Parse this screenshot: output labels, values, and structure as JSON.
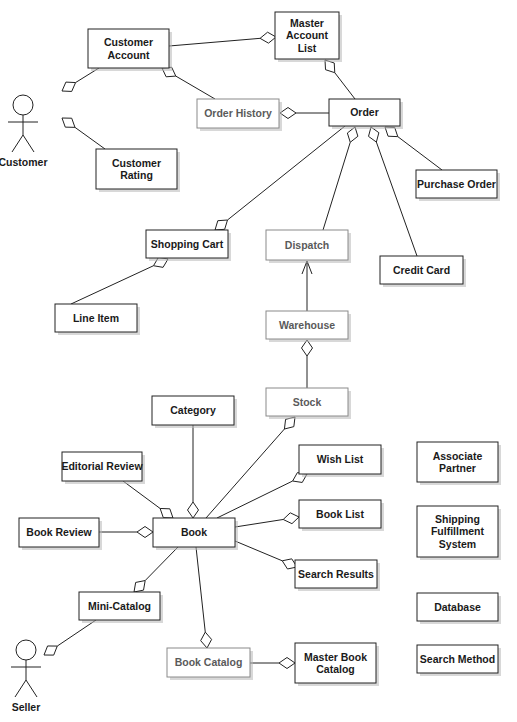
{
  "diagram": {
    "type": "UML class diagram (online bookstore)",
    "actors": [
      {
        "id": "customer",
        "label": "Customer",
        "x": 20,
        "y": 95
      },
      {
        "id": "seller",
        "label": "Seller",
        "x": 23,
        "y": 640
      }
    ],
    "classes": [
      {
        "id": "customer-account",
        "lines": [
          "Customer",
          "Account"
        ],
        "x": 88,
        "y": 29,
        "w": 81,
        "h": 39,
        "dim": false
      },
      {
        "id": "master-account-list",
        "lines": [
          "Master",
          "Account",
          "List"
        ],
        "x": 275,
        "y": 12,
        "w": 64,
        "h": 47,
        "dim": false
      },
      {
        "id": "order-history",
        "lines": [
          "Order History"
        ],
        "x": 197,
        "y": 99,
        "w": 82,
        "h": 29,
        "dim": true
      },
      {
        "id": "order",
        "lines": [
          "Order"
        ],
        "x": 329,
        "y": 99,
        "w": 71,
        "h": 27,
        "dim": false
      },
      {
        "id": "customer-rating",
        "lines": [
          "Customer",
          "Rating"
        ],
        "x": 96,
        "y": 149,
        "w": 81,
        "h": 40,
        "dim": false
      },
      {
        "id": "purchase-order",
        "lines": [
          "Purchase Order"
        ],
        "x": 416,
        "y": 170,
        "w": 81,
        "h": 28,
        "dim": false
      },
      {
        "id": "shopping-cart",
        "lines": [
          "Shopping Cart"
        ],
        "x": 146,
        "y": 230,
        "w": 82,
        "h": 28,
        "dim": false
      },
      {
        "id": "dispatch",
        "lines": [
          "Dispatch"
        ],
        "x": 266,
        "y": 230,
        "w": 82,
        "h": 30,
        "dim": true
      },
      {
        "id": "credit-card",
        "lines": [
          "Credit Card"
        ],
        "x": 380,
        "y": 256,
        "w": 83,
        "h": 28,
        "dim": false
      },
      {
        "id": "line-item",
        "lines": [
          "Line Item"
        ],
        "x": 55,
        "y": 304,
        "w": 82,
        "h": 28,
        "dim": false
      },
      {
        "id": "warehouse",
        "lines": [
          "Warehouse"
        ],
        "x": 266,
        "y": 311,
        "w": 82,
        "h": 28,
        "dim": true
      },
      {
        "id": "category",
        "lines": [
          "Category"
        ],
        "x": 152,
        "y": 396,
        "w": 82,
        "h": 29,
        "dim": false
      },
      {
        "id": "stock",
        "lines": [
          "Stock"
        ],
        "x": 266,
        "y": 388,
        "w": 82,
        "h": 28,
        "dim": true
      },
      {
        "id": "editorial-review",
        "lines": [
          "Editorial Review"
        ],
        "x": 62,
        "y": 452,
        "w": 80,
        "h": 29,
        "dim": false
      },
      {
        "id": "wish-list",
        "lines": [
          "Wish List"
        ],
        "x": 299,
        "y": 445,
        "w": 82,
        "h": 29,
        "dim": false
      },
      {
        "id": "associate-partner",
        "lines": [
          "Associate",
          "Partner"
        ],
        "x": 417,
        "y": 442,
        "w": 81,
        "h": 40,
        "dim": false
      },
      {
        "id": "book-review",
        "lines": [
          "Book Review"
        ],
        "x": 19,
        "y": 518,
        "w": 80,
        "h": 29,
        "dim": false
      },
      {
        "id": "book",
        "lines": [
          "Book"
        ],
        "x": 153,
        "y": 518,
        "w": 82,
        "h": 29,
        "dim": false
      },
      {
        "id": "book-list",
        "lines": [
          "Book List"
        ],
        "x": 299,
        "y": 500,
        "w": 82,
        "h": 28,
        "dim": false
      },
      {
        "id": "shipping-fulfillment-system",
        "lines": [
          "Shipping",
          "Fulfillment",
          "System"
        ],
        "x": 417,
        "y": 506,
        "w": 81,
        "h": 51,
        "dim": false
      },
      {
        "id": "search-results",
        "lines": [
          "Search Results"
        ],
        "x": 295,
        "y": 560,
        "w": 82,
        "h": 28,
        "dim": false
      },
      {
        "id": "mini-catalog",
        "lines": [
          "Mini-Catalog"
        ],
        "x": 79,
        "y": 592,
        "w": 81,
        "h": 28,
        "dim": false
      },
      {
        "id": "database",
        "lines": [
          "Database"
        ],
        "x": 417,
        "y": 593,
        "w": 81,
        "h": 28,
        "dim": false
      },
      {
        "id": "book-catalog",
        "lines": [
          "Book Catalog"
        ],
        "x": 167,
        "y": 648,
        "w": 83,
        "h": 29,
        "dim": true
      },
      {
        "id": "master-book-catalog",
        "lines": [
          "Master Book",
          "Catalog"
        ],
        "x": 295,
        "y": 643,
        "w": 81,
        "h": 40,
        "dim": false
      },
      {
        "id": "search-method",
        "lines": [
          "Search Method"
        ],
        "x": 417,
        "y": 645,
        "w": 81,
        "h": 28,
        "dim": false
      }
    ],
    "associations": [
      {
        "from": [
          169,
          46
        ],
        "to": [
          276,
          37
        ],
        "end": "diamond",
        "end_at": "to",
        "note": "Customer Account -> Master Account List"
      },
      {
        "from": [
          99,
          68
        ],
        "to": [
          62,
          91
        ],
        "end": "diamond",
        "end_at": "to",
        "note": "Customer Account -> Customer"
      },
      {
        "from": [
          215,
          99
        ],
        "to": [
          162,
          68
        ],
        "end": "diamond",
        "end_at": "to",
        "note": "Order History -> Customer Account"
      },
      {
        "from": [
          105,
          149
        ],
        "to": [
          62,
          118
        ],
        "end": "diamond",
        "end_at": "to",
        "note": "Customer Rating -> Customer"
      },
      {
        "from": [
          355,
          99
        ],
        "to": [
          325,
          60
        ],
        "end": "diamond",
        "end_at": "to",
        "note": "Order -> Master Account List"
      },
      {
        "from": [
          329,
          113
        ],
        "to": [
          280,
          113
        ],
        "end": "diamond",
        "end_at": "to",
        "note": "Order -> Order History"
      },
      {
        "from": [
          345,
          126
        ],
        "to": [
          215,
          230
        ],
        "end": "diamond",
        "end_at": "to",
        "note": "Order -> Shopping Cart"
      },
      {
        "from": [
          323,
          230
        ],
        "to": [
          355,
          127
        ],
        "end": "diamond",
        "end_at": "to",
        "note": "Dispatch -> Order"
      },
      {
        "from": [
          417,
          256
        ],
        "to": [
          371,
          127
        ],
        "end": "diamond",
        "end_at": "to",
        "note": "Credit Card -> Order"
      },
      {
        "from": [
          442,
          170
        ],
        "to": [
          385,
          127
        ],
        "end": "diamond",
        "end_at": "to",
        "note": "Purchase Order -> Order"
      },
      {
        "from": [
          71,
          304
        ],
        "to": [
          168,
          259
        ],
        "end": "diamond",
        "end_at": "to",
        "note": "Line Item -> Shopping Cart"
      },
      {
        "from": [
          307,
          311
        ],
        "to": [
          307,
          261
        ],
        "end": "arrow",
        "end_at": "to",
        "note": "Warehouse -> Dispatch"
      },
      {
        "from": [
          307,
          388
        ],
        "to": [
          307,
          340
        ],
        "end": "diamond",
        "end_at": "to",
        "note": "Stock -> Warehouse"
      },
      {
        "from": [
          193,
          425
        ],
        "to": [
          193,
          518
        ],
        "end": "diamond",
        "end_at": "to",
        "note": "Category -> Book"
      },
      {
        "from": [
          123,
          481
        ],
        "to": [
          173,
          518
        ],
        "end": "diamond",
        "end_at": "to",
        "note": "Editorial Review -> Book"
      },
      {
        "from": [
          99,
          532
        ],
        "to": [
          153,
          532
        ],
        "end": "diamond",
        "end_at": "to",
        "note": "Book Review -> Book"
      },
      {
        "from": [
          206,
          518
        ],
        "to": [
          295,
          417
        ],
        "end": "diamond",
        "end_at": "to",
        "note": "Book -> Stock"
      },
      {
        "from": [
          217,
          518
        ],
        "to": [
          307,
          474
        ],
        "end": "diamond",
        "end_at": "to",
        "note": "Book -> Wish List"
      },
      {
        "from": [
          235,
          527
        ],
        "to": [
          299,
          517
        ],
        "end": "diamond",
        "end_at": "to",
        "note": "Book -> Book List"
      },
      {
        "from": [
          235,
          541
        ],
        "to": [
          297,
          567
        ],
        "end": "diamond",
        "end_at": "to",
        "note": "Book -> Search Results"
      },
      {
        "from": [
          178,
          547
        ],
        "to": [
          134,
          592
        ],
        "end": "diamond",
        "end_at": "to",
        "note": "Book -> Mini-Catalog"
      },
      {
        "from": [
          196,
          547
        ],
        "to": [
          207,
          648
        ],
        "end": "diamond",
        "end_at": "to",
        "note": "Book -> Book Catalog"
      },
      {
        "from": [
          96,
          620
        ],
        "to": [
          44,
          655
        ],
        "end": "diamond",
        "end_at": "to",
        "note": "Mini-Catalog -> Seller"
      },
      {
        "from": [
          250,
          663
        ],
        "to": [
          295,
          663
        ],
        "end": "diamond",
        "end_at": "to",
        "note": "Book Catalog -> Master Book Catalog"
      }
    ]
  },
  "colors": {
    "background": "#ffffff",
    "stroke": "#222222",
    "text": "#1a1a1a",
    "dim_text": "#5a5a5a",
    "dim_stroke": "#8a8a8a",
    "shadow": "#b8b8b8"
  }
}
